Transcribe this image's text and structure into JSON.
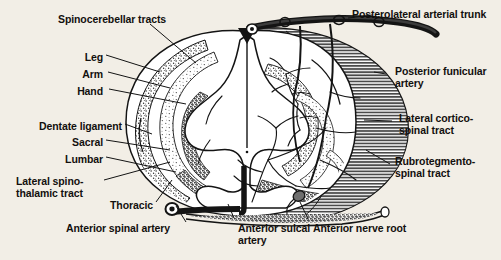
{
  "figure": {
    "background_color": "#f2eee6",
    "ink_color": "#12100e",
    "shell_fill": "#9a9a9a",
    "labels_left": [
      {
        "id": "spinocerebellar-tracts",
        "text": "Spinocerebellar tracts",
        "x": 58,
        "y": 14,
        "align": "left"
      },
      {
        "id": "leg",
        "text": "Leg",
        "x": 75,
        "y": 58,
        "align": "right",
        "right_edge": 103
      },
      {
        "id": "arm",
        "text": "Arm",
        "x": 71,
        "y": 75,
        "align": "right",
        "right_edge": 103
      },
      {
        "id": "hand",
        "text": "Hand",
        "x": 64,
        "y": 92,
        "align": "right",
        "right_edge": 103
      },
      {
        "id": "dentate-ligament",
        "text": "Dentate ligament",
        "x": 16,
        "y": 126,
        "align": "right",
        "right_edge": 122
      },
      {
        "id": "sacral",
        "text": "Sacral",
        "x": 61,
        "y": 143,
        "align": "right",
        "right_edge": 103
      },
      {
        "id": "lumbar",
        "text": "Lumbar",
        "x": 56,
        "y": 160,
        "align": "right",
        "right_edge": 103
      },
      {
        "id": "lateral-spinothalamic-tract",
        "text": "Lateral spino-\nthalamic tract",
        "x": 16,
        "y": 181,
        "align": "left"
      },
      {
        "id": "thoracic",
        "text": "Thoracic",
        "x": 110,
        "y": 205,
        "align": "left"
      },
      {
        "id": "anterior-spinal-artery",
        "text": "Anterior spinal artery",
        "x": 66,
        "y": 222,
        "align": "left"
      }
    ],
    "labels_right": [
      {
        "id": "posterolateral-arterial-trunk",
        "text": "Posterolateral arterial trunk",
        "x": 352,
        "y": 11,
        "align": "left"
      },
      {
        "id": "posterior-funicular-artery",
        "text": "Posterior funicular\nartery",
        "x": 395,
        "y": 70,
        "align": "left"
      },
      {
        "id": "lateral-corticospinal-tract",
        "text": "Lateral cortico-\nspinal tract",
        "x": 399,
        "y": 117,
        "align": "left"
      },
      {
        "id": "rubrotegmentospinal-tract",
        "text": "Rubrotegmento-\nspinal tract",
        "x": 395,
        "y": 160,
        "align": "left"
      }
    ],
    "labels_bottom": [
      {
        "id": "anterior-sulcal-artery",
        "text": "Anterior sulcal\nartery",
        "x": 218,
        "y": 222,
        "align": "left"
      },
      {
        "id": "anterior-nerve-root",
        "text": "Anterior nerve root",
        "x": 310,
        "y": 222,
        "align": "left"
      }
    ],
    "anatomy_parts": [
      "spinal-cord-outline",
      "gray-matter-butterfly",
      "posterior-median-septum",
      "anterior-median-fissure",
      "hatched-white-matter-shell",
      "stippled-tract-zones",
      "arterial-network",
      "posterolateral-arterial-trunk-vessel",
      "anterior-spinal-artery-vessel",
      "anterior-sulcal-artery-vessel",
      "anterior-nerve-root-bundle",
      "dentate-ligament-band"
    ]
  }
}
